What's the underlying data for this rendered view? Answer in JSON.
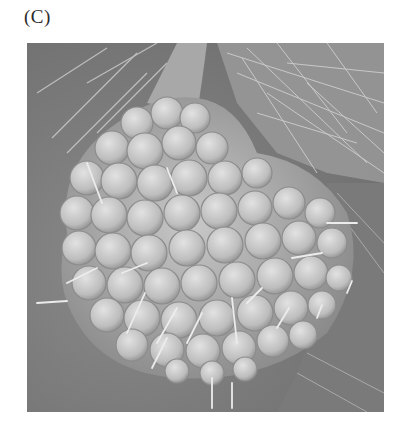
{
  "figure": {
    "panel_label": "(C)",
    "image": {
      "type": "scanning-electron-micrograph",
      "subject": "cellular berry-shaped structure with bristles",
      "colors": {
        "background": "#7d7d7d",
        "cell_light": "#d4d4d4",
        "cell_mid": "#b8b8b8",
        "cell_edge": "#8e8e8e",
        "bristle": "#e6e6e6",
        "hair_dark": "#5a5a5a"
      }
    }
  }
}
